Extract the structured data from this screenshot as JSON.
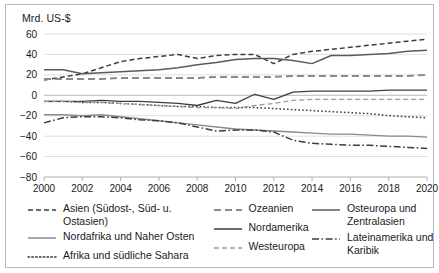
{
  "axis_title": "Mrd. US-$",
  "legend": {
    "columns": [
      [
        {
          "label": "Asien (Südost-, Süd- u. Ostasien)",
          "style": "dashed",
          "color": "#3d3d3d",
          "key": "asien"
        },
        {
          "label": "Nordafrika und Naher Osten",
          "style": "solid",
          "color": "#8a8a8a",
          "key": "nordafrika"
        },
        {
          "label": "Afrika und südliche Sahara",
          "style": "dotted",
          "color": "#3d3d3d",
          "key": "afrika"
        }
      ],
      [
        {
          "label": "Ozeanien",
          "style": "dashed-long",
          "color": "#8a8a8a",
          "key": "ozeanien"
        },
        {
          "label": "Nordamerika",
          "style": "solid",
          "color": "#3d3d3d",
          "key": "nordamerika"
        },
        {
          "label": "Westeuropa",
          "style": "dashed",
          "color": "#9a9a9a",
          "key": "westeuropa"
        }
      ],
      [
        {
          "label": "Osteuropa und\nZentralasien",
          "style": "solid",
          "color": "#5a5a5a",
          "key": "osteuropa"
        },
        {
          "label": "Lateinamerika und\nKaribik",
          "style": "dashdot",
          "color": "#3d3d3d",
          "key": "lateinamerika"
        }
      ]
    ]
  },
  "chart_data": {
    "type": "line",
    "title": "",
    "xlabel": "",
    "ylabel": "Mrd. US-$",
    "ylim": [
      -80,
      60
    ],
    "xlim": [
      2000,
      2020
    ],
    "yticks": [
      60,
      40,
      20,
      0,
      -20,
      -40,
      -60,
      -80
    ],
    "ytick_labels": [
      "60",
      "40",
      "20",
      "0",
      "−20",
      "−40",
      "−60",
      "−80"
    ],
    "xticks": [
      2000,
      2002,
      2004,
      2006,
      2008,
      2010,
      2012,
      2014,
      2016,
      2018,
      2020
    ],
    "xtick_labels": [
      "2000",
      "2002",
      "2004",
      "2006",
      "2008",
      "2010",
      "2012",
      "2014",
      "2016",
      "2018",
      "2020"
    ],
    "grid": true,
    "legend_position": "bottom",
    "x": [
      2000,
      2001,
      2002,
      2003,
      2004,
      2005,
      2006,
      2007,
      2008,
      2009,
      2010,
      2011,
      2012,
      2013,
      2014,
      2015,
      2016,
      2017,
      2018,
      2019,
      2020
    ],
    "series": [
      {
        "name": "Asien (Südost-, Süd- u. Ostasien)",
        "key": "asien",
        "style": "dashed",
        "color": "#3d3d3d",
        "width": 1.5,
        "values": [
          15,
          18,
          21,
          27,
          33,
          36,
          38,
          40,
          36,
          39,
          40,
          40,
          31,
          40,
          43,
          45,
          47,
          49,
          51,
          53,
          55
        ]
      },
      {
        "name": "Nordafrika und Naher Osten",
        "key": "nordafrika",
        "style": "solid",
        "color": "#8a8a8a",
        "width": 1.4,
        "values": [
          -19,
          -19,
          -20,
          -19,
          -21,
          -23,
          -25,
          -27,
          -29,
          -31,
          -33,
          -34,
          -35,
          -36,
          -37,
          -38,
          -38,
          -39,
          -40,
          -40,
          -41
        ]
      },
      {
        "name": "Afrika und südliche Sahara",
        "key": "afrika",
        "style": "dotted",
        "color": "#3d3d3d",
        "width": 1.5,
        "values": [
          -6,
          -6,
          -7,
          -7,
          -8,
          -9,
          -10,
          -11,
          -11,
          -12,
          -12,
          -12,
          -13,
          -14,
          -15,
          -16,
          -17,
          -18,
          -20,
          -21,
          -22
        ]
      },
      {
        "name": "Ozeanien",
        "key": "ozeanien",
        "style": "dashed-long",
        "color": "#8a8a8a",
        "width": 2.0,
        "values": [
          16,
          16,
          16,
          16,
          17,
          17,
          17,
          17,
          17,
          18,
          18,
          18,
          18,
          19,
          19,
          19,
          19,
          19,
          19,
          19,
          20
        ]
      },
      {
        "name": "Nordamerika",
        "key": "nordamerika",
        "style": "solid",
        "color": "#3d3d3d",
        "width": 1.3,
        "values": [
          -6,
          -6,
          -6,
          -5,
          -6,
          -6,
          -7,
          -8,
          -10,
          -5,
          -8,
          1,
          -4,
          3,
          4,
          4,
          4,
          4,
          5,
          5,
          5
        ]
      },
      {
        "name": "Westeuropa",
        "key": "westeuropa",
        "style": "dashed",
        "color": "#9a9a9a",
        "width": 1.3,
        "values": [
          -6,
          -6,
          -7,
          -7,
          -8,
          -9,
          -10,
          -11,
          -12,
          -12,
          -13,
          -10,
          -8,
          -5,
          -4,
          -4,
          -4,
          -4,
          -4,
          -4,
          -4
        ]
      },
      {
        "name": "Osteuropa und Zentralasien",
        "key": "osteuropa",
        "style": "solid",
        "color": "#5a5a5a",
        "width": 1.5,
        "values": [
          25,
          25,
          21,
          22,
          23,
          24,
          25,
          27,
          30,
          32,
          35,
          36,
          36,
          34,
          31,
          39,
          39,
          40,
          41,
          43,
          44
        ]
      },
      {
        "name": "Lateinamerika und Karibik",
        "key": "lateinamerika",
        "style": "dashdot",
        "color": "#3d3d3d",
        "width": 1.5,
        "values": [
          -27,
          -22,
          -21,
          -21,
          -22,
          -24,
          -25,
          -27,
          -31,
          -35,
          -34,
          -34,
          -36,
          -44,
          -47,
          -48,
          -49,
          -49,
          -50,
          -51,
          -52
        ]
      }
    ]
  }
}
